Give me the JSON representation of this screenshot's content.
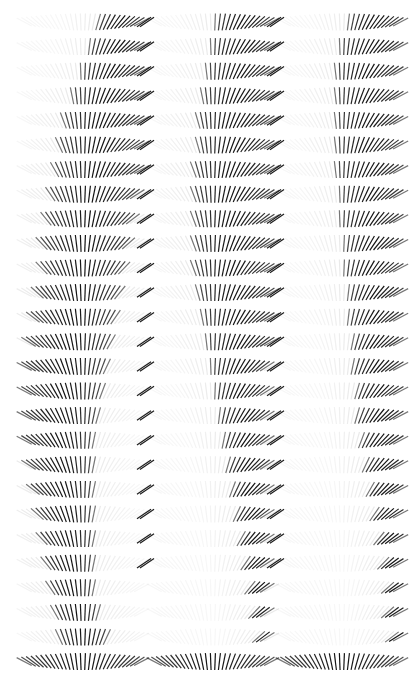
{
  "figure": {
    "title": "",
    "type": "stroke-fan-grid",
    "background_color": "#ffffff",
    "stroke_color": "#111111",
    "width": 419,
    "height": 697
  },
  "chart_data": {
    "type": "heatmap",
    "title": "",
    "subtitle": "",
    "xlabel": "",
    "ylabel": "",
    "grid": false,
    "legend": null,
    "panels": [
      "panel-1",
      "panel-2",
      "panel-3"
    ],
    "n_panels": 3,
    "n_rows": 27,
    "n_strokes_per_row": 28,
    "angle_deg_start": -62,
    "angle_deg_end": 62,
    "stroke_length_px": 17,
    "stroke_width_px": 1.2,
    "stroke_spacing_px": 4.35,
    "row_spacing_px": 24.6,
    "row_first_y_px": 22,
    "panel_x_origins_px": [
      22,
      152,
      281
    ],
    "panel_width_px": 118,
    "opacity_min": 0.06,
    "opacity_max": 1.0,
    "ghost_opacity": 0.1,
    "series": [
      {
        "name": "panel-1",
        "window_start": [
          17,
          15,
          13,
          11,
          9,
          8,
          7,
          6,
          5,
          4,
          4,
          3,
          2,
          1,
          0,
          0,
          0,
          0,
          1,
          2,
          3,
          4,
          5,
          6,
          7,
          8,
          0
        ],
        "window_end": [
          27,
          27,
          27,
          27,
          27,
          27,
          27,
          26,
          25,
          24,
          23,
          22,
          21,
          20,
          19,
          18,
          17,
          16,
          16,
          16,
          16,
          16,
          16,
          16,
          17,
          19,
          27
        ],
        "tail_marks": [
          1,
          1,
          1,
          1,
          1,
          1,
          1,
          1,
          1,
          1,
          1,
          1,
          1,
          1,
          1,
          1,
          1,
          1,
          1,
          1,
          1,
          1,
          1,
          0,
          0,
          0,
          0
        ]
      },
      {
        "name": "panel-2",
        "window_start": [
          14,
          13,
          12,
          11,
          10,
          10,
          9,
          9,
          9,
          9,
          9,
          10,
          11,
          12,
          13,
          14,
          15,
          16,
          17,
          18,
          19,
          20,
          21,
          22,
          23,
          24,
          0
        ],
        "window_end": [
          27,
          27,
          27,
          27,
          27,
          27,
          27,
          27,
          27,
          27,
          27,
          27,
          27,
          27,
          26,
          26,
          26,
          26,
          26,
          26,
          26,
          26,
          26,
          26,
          26,
          26,
          27
        ],
        "tail_marks": [
          1,
          1,
          1,
          1,
          1,
          1,
          1,
          1,
          1,
          1,
          1,
          1,
          1,
          1,
          1,
          1,
          1,
          1,
          1,
          1,
          1,
          1,
          1,
          0,
          0,
          0,
          0
        ]
      },
      {
        "name": "panel-3",
        "window_start": [
          15,
          13,
          12,
          12,
          12,
          12,
          12,
          13,
          13,
          14,
          14,
          15,
          15,
          16,
          16,
          17,
          17,
          18,
          19,
          20,
          21,
          22,
          23,
          24,
          24,
          25,
          0
        ],
        "window_end": [
          27,
          27,
          27,
          27,
          27,
          27,
          27,
          27,
          27,
          27,
          27,
          27,
          27,
          27,
          27,
          27,
          27,
          27,
          27,
          27,
          27,
          27,
          27,
          27,
          27,
          27,
          27
        ]
      }
    ]
  }
}
